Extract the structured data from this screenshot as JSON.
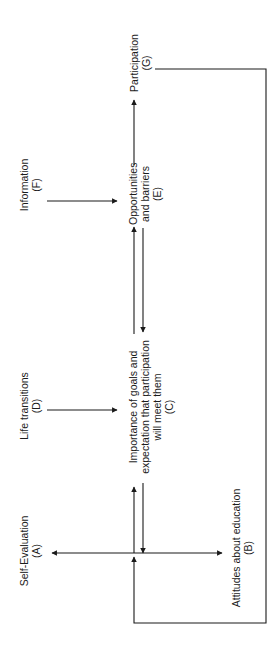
{
  "diagram": {
    "type": "flow-model",
    "orientation": "rotated-90-ccw",
    "line_color": "#1a1a1a",
    "nodes": {
      "A": {
        "label": "Self-Evaluation",
        "id": "(A)"
      },
      "B": {
        "label": "Attitudes about education",
        "id": "(B)"
      },
      "C": {
        "line1": "Importance of goals and",
        "line2": "expectation that participation",
        "line3": "will meet them",
        "id": "(C)"
      },
      "D": {
        "label": "Life transitions",
        "id": "(D)"
      },
      "E": {
        "line1": "Opportunities",
        "line2": "and barriers",
        "id": "(E)"
      },
      "F": {
        "label": "Information",
        "id": "(F)"
      },
      "G": {
        "label": "Participation",
        "id": "(G)"
      }
    },
    "edges": [
      {
        "from": "A",
        "to": "B",
        "type": "bidirectional"
      },
      {
        "from": "A-B",
        "to": "C",
        "type": "bidirectional"
      },
      {
        "from": "D",
        "to": "C"
      },
      {
        "from": "C",
        "to": "E"
      },
      {
        "from": "E",
        "to": "C"
      },
      {
        "from": "F",
        "to": "E"
      },
      {
        "from": "E",
        "to": "G"
      },
      {
        "from": "G",
        "to": "A-B",
        "type": "feedback-loop"
      }
    ]
  }
}
